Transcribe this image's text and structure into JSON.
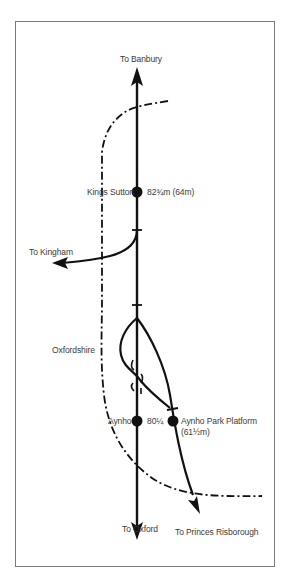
{
  "diagram": {
    "type": "railway-junction-map",
    "colors": {
      "line": "#111111",
      "boundary": "#111111",
      "text": "#3a3a3a",
      "frame": "#7a7a7a",
      "background": "#ffffff"
    },
    "destinations": {
      "north": "To Banbury",
      "south": "To Oxford",
      "west": "To Kingham",
      "southeast": "To Princes Risborough"
    },
    "region_label": "Oxfordshire",
    "stations": [
      {
        "name": "Kings Sutton",
        "mileage": "82¾m (64m)"
      },
      {
        "name": "Aynho",
        "mileage": "80¼"
      },
      {
        "name": "Aynho Park Platform",
        "mileage": "(61½m)"
      }
    ]
  }
}
